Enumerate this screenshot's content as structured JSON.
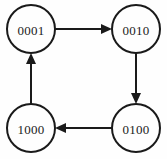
{
  "diagram": {
    "type": "state-transition-cycle",
    "title": "",
    "background_color": "#fefefe",
    "stroke_color": "#1a1a1a",
    "node_fill": "#fefefe",
    "nodes": [
      {
        "id": "n0",
        "label": "0001",
        "cx": 31,
        "cy": 29,
        "r": 24,
        "position": "top-left"
      },
      {
        "id": "n1",
        "label": "0010",
        "cx": 136,
        "cy": 29,
        "r": 24,
        "position": "top-right"
      },
      {
        "id": "n2",
        "label": "0100",
        "cx": 136,
        "cy": 128,
        "r": 24,
        "position": "bottom-right"
      },
      {
        "id": "n3",
        "label": "1000",
        "cx": 31,
        "cy": 128,
        "r": 24,
        "position": "bottom-left"
      }
    ],
    "edges": [
      {
        "id": "e0",
        "from": "0001",
        "to": "0010",
        "direction": "right",
        "arrowhead": "filled-triangle"
      },
      {
        "id": "e1",
        "from": "0010",
        "to": "0100",
        "direction": "down",
        "arrowhead": "filled-triangle"
      },
      {
        "id": "e2",
        "from": "0100",
        "to": "1000",
        "direction": "left",
        "arrowhead": "filled-triangle"
      },
      {
        "id": "e3",
        "from": "1000",
        "to": "0001",
        "direction": "up",
        "arrowhead": "filled-triangle"
      }
    ]
  }
}
